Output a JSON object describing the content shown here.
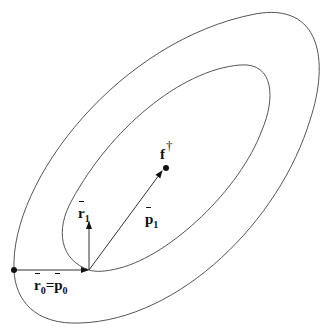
{
  "diagram": {
    "type": "conjugate-gradient-contours",
    "labels": {
      "r1": {
        "base": "r",
        "sub": "1"
      },
      "p1": {
        "base": "p",
        "sub": "1"
      },
      "r0_eq_p0": {
        "left_base": "r",
        "left_sub": "0",
        "eq": "=",
        "right_base": "p",
        "right_sub": "0"
      },
      "f_dagger": {
        "base": "f",
        "sup": "†"
      }
    },
    "colors": {
      "stroke": "#555555",
      "ink": "#111111",
      "background": "#ffffff"
    }
  }
}
